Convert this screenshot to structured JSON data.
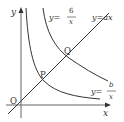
{
  "diagram": {
    "axes": {
      "x_label": "x",
      "y_label": "y",
      "origin_label": "O"
    },
    "points": [
      {
        "label": "P"
      },
      {
        "label": "Q"
      }
    ],
    "curves": {
      "hyperbola_6": {
        "lhs": "y=",
        "numerator": "6",
        "denominator": "x"
      },
      "hyperbola_b": {
        "lhs": "y=",
        "numerator": "b",
        "denominator": "x"
      },
      "line": {
        "label": "y=ax"
      }
    },
    "colors": {
      "stroke": "#333333",
      "background": "#ffffff"
    }
  }
}
